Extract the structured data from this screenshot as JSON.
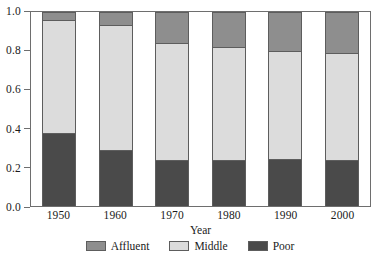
{
  "chart_data": {
    "type": "bar",
    "subtype": "stacked-bar-100-percent",
    "title": "",
    "xlabel": "Year",
    "ylabel": "",
    "categories": [
      "1950",
      "1960",
      "1970",
      "1980",
      "1990",
      "2000"
    ],
    "series": [
      {
        "name": "Affluent",
        "color": "#8e8e8e",
        "values": [
          0.045,
          0.07,
          0.165,
          0.185,
          0.205,
          0.215
        ]
      },
      {
        "name": "Middle",
        "color": "#dcdcdc",
        "values": [
          0.585,
          0.645,
          0.605,
          0.585,
          0.56,
          0.555
        ]
      },
      {
        "name": "Poor",
        "color": "#4a4a4a",
        "values": [
          0.37,
          0.285,
          0.23,
          0.23,
          0.235,
          0.23
        ]
      }
    ],
    "stack_order_bottom_to_top": [
      "Poor",
      "Middle",
      "Affluent"
    ],
    "cumulative_tops": {
      "poor": [
        0.37,
        0.285,
        0.23,
        0.23,
        0.235,
        0.23
      ],
      "middle": [
        0.955,
        0.93,
        0.835,
        0.815,
        0.795,
        0.785
      ],
      "affluent": [
        1.0,
        1.0,
        1.0,
        1.0,
        1.0,
        1.0
      ]
    },
    "ylim": [
      0.0,
      1.0
    ],
    "yticks": [
      0.0,
      0.2,
      0.4,
      0.6,
      0.8,
      1.0
    ],
    "ytick_labels": [
      "0.0",
      "0.2",
      "0.4",
      "0.6",
      "0.8",
      "1.0"
    ],
    "grid": false,
    "legend_position": "bottom-center"
  },
  "axes": {
    "x_title": "Year",
    "x_tick_labels": [
      "1950",
      "1960",
      "1970",
      "1980",
      "1990",
      "2000"
    ],
    "y_tick_labels": [
      "1.0",
      "0.8",
      "0.6",
      "0.4",
      "0.2",
      "0.0"
    ]
  },
  "legend": {
    "items": [
      {
        "label": "Affluent",
        "color": "#8e8e8e"
      },
      {
        "label": "Middle",
        "color": "#dcdcdc"
      },
      {
        "label": "Poor",
        "color": "#4a4a4a"
      }
    ]
  },
  "colors": {
    "affluent": "#8e8e8e",
    "middle": "#dcdcdc",
    "poor": "#4a4a4a",
    "frame": "#6e6e6e",
    "text": "#1a1a1a",
    "background": "#ffffff"
  }
}
